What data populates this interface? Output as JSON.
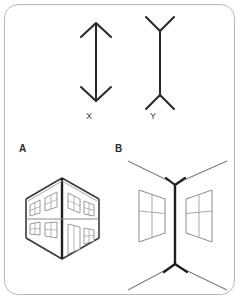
{
  "figure": {
    "background_color": "#ffffff",
    "frame": {
      "border_color": "#b9b9b9",
      "corner_radius_px": 14
    },
    "stroke_colors": {
      "heavy_line": "#2b2b2b",
      "light_line": "#8a8a8a",
      "medium_line": "#6f6f6f",
      "pane_line": "#9a9a9a"
    }
  },
  "labels": {
    "line_figure_left": "X",
    "line_figure_right": "Y",
    "scene_left": "A",
    "scene_right": "B"
  },
  "line_figures": [
    {
      "id": "x",
      "label": "X",
      "description": "vertical shaft with arrowheads pointing inward at both ends",
      "fin_direction": "inward",
      "shaft": {
        "x": 96,
        "y_top": 22,
        "y_bottom": 102
      },
      "fins": {
        "top": [
          [
            82,
            36
          ],
          [
            96,
            22
          ],
          [
            110,
            36
          ]
        ],
        "bottom": [
          [
            82,
            88
          ],
          [
            96,
            102
          ],
          [
            110,
            88
          ]
        ]
      }
    },
    {
      "id": "y",
      "label": "Y",
      "description": "vertical shaft with fins splaying outward at both ends",
      "fin_direction": "outward",
      "shaft": {
        "x": 160,
        "y_top": 30,
        "y_bottom": 96
      },
      "fins": {
        "top": [
          [
            146,
            17
          ],
          [
            160,
            30
          ],
          [
            174,
            17
          ]
        ],
        "bottom": [
          [
            146,
            109
          ],
          [
            160,
            96
          ],
          [
            174,
            109
          ]
        ]
      }
    }
  ],
  "scenes": [
    {
      "id": "a",
      "label": "A",
      "name": "building-exterior-corner",
      "description": "outside corner of a two-storey building, near vertical edge",
      "corner_type": "convex",
      "matches_line_figure": "X",
      "floors": 2,
      "left_face_windows": 2,
      "right_face_upper_windows": 2,
      "right_face_lower_windows": 1,
      "doors": 1
    },
    {
      "id": "b",
      "label": "B",
      "name": "room-interior-corner",
      "description": "inside corner of a room with ceiling and floor lines receding, one window per wall",
      "corner_type": "concave",
      "matches_line_figure": "Y",
      "windows": 2
    }
  ]
}
